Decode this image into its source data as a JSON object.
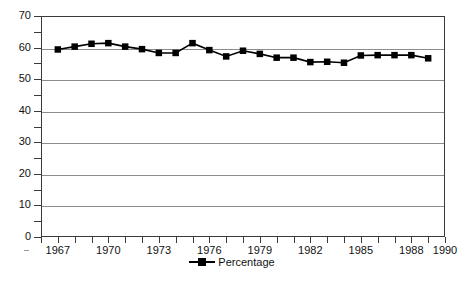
{
  "chart_data": {
    "type": "line",
    "title": "",
    "xlabel": "",
    "ylabel": "",
    "ylim": [
      0,
      70
    ],
    "xlim": [
      1966,
      1990
    ],
    "y_ticks_major": [
      0,
      10,
      20,
      30,
      40,
      50,
      60,
      70
    ],
    "y_ticks_minor": [
      5,
      15,
      25,
      35,
      45,
      55,
      65
    ],
    "y_tick_labels": [
      "0",
      "10",
      "20",
      "30",
      "40",
      "50",
      "60",
      "70"
    ],
    "x_tick_labels": [
      "1967",
      "1970",
      "1973",
      "1976",
      "1979",
      "1982",
      "1985",
      "1988",
      "1990"
    ],
    "x_tick_label_values": [
      1967,
      1970,
      1973,
      1976,
      1979,
      1982,
      1985,
      1988,
      1990
    ],
    "x_tick_values": [
      1966,
      1967,
      1968,
      1969,
      1970,
      1971,
      1972,
      1973,
      1974,
      1975,
      1976,
      1977,
      1978,
      1979,
      1980,
      1981,
      1982,
      1983,
      1984,
      1985,
      1986,
      1987,
      1988,
      1989,
      1990
    ],
    "grid": "horizontal",
    "legend_position": "bottom-center",
    "marker": "square",
    "series": [
      {
        "name": "Percentage",
        "color": "#000000",
        "x": [
          1967,
          1968,
          1969,
          1970,
          1971,
          1972,
          1973,
          1974,
          1975,
          1976,
          1977,
          1978,
          1979,
          1980,
          1981,
          1982,
          1983,
          1984,
          1985,
          1986,
          1987,
          1988,
          1989
        ],
        "values": [
          59.4,
          60.3,
          61.2,
          61.4,
          60.3,
          59.5,
          58.3,
          58.3,
          61.4,
          59.2,
          57.2,
          59.0,
          58.0,
          56.8,
          56.8,
          55.4,
          55.5,
          55.2,
          57.5,
          57.6,
          57.6,
          57.6,
          56.6
        ],
        "points": [
          {
            "x": 1967,
            "y": 59.4
          },
          {
            "x": 1968,
            "y": 60.3
          },
          {
            "x": 1969,
            "y": 61.2
          },
          {
            "x": 1970,
            "y": 61.4
          },
          {
            "x": 1971,
            "y": 60.3
          },
          {
            "x": 1972,
            "y": 59.5
          },
          {
            "x": 1973,
            "y": 58.3
          },
          {
            "x": 1974,
            "y": 58.3
          },
          {
            "x": 1975,
            "y": 61.4
          },
          {
            "x": 1976,
            "y": 59.2
          },
          {
            "x": 1977,
            "y": 57.2
          },
          {
            "x": 1978,
            "y": 59.0
          },
          {
            "x": 1979,
            "y": 58.0
          },
          {
            "x": 1980,
            "y": 56.8
          },
          {
            "x": 1981,
            "y": 56.8
          },
          {
            "x": 1982,
            "y": 55.4
          },
          {
            "x": 1983,
            "y": 55.5
          },
          {
            "x": 1984,
            "y": 55.2
          },
          {
            "x": 1985,
            "y": 57.5
          },
          {
            "x": 1986,
            "y": 57.6
          },
          {
            "x": 1987,
            "y": 57.6
          },
          {
            "x": 1988,
            "y": 57.6
          },
          {
            "x": 1989,
            "y": 56.6
          }
        ]
      }
    ]
  },
  "legend": {
    "entries": [
      {
        "label": "Percentage",
        "marker": "filled-square-marker",
        "color": "#000000"
      }
    ]
  },
  "colors": {
    "axis": "#3a3a3a",
    "grid": "#8c8c8c",
    "series": "#000000",
    "background": "#ffffff"
  }
}
